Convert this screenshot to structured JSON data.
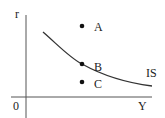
{
  "diagram": {
    "axes": {
      "y_label": "r",
      "x_label": "Y",
      "origin_label": "0"
    },
    "curve": {
      "label": "IS",
      "color": "#333333"
    },
    "points": [
      {
        "label": "A",
        "position": "above IS curve"
      },
      {
        "label": "B",
        "position": "on IS curve"
      },
      {
        "label": "C",
        "position": "below IS curve"
      }
    ],
    "colors": {
      "axis": "#555555",
      "text": "#222222",
      "point": "#111111"
    }
  }
}
